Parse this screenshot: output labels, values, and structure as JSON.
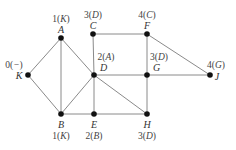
{
  "graph": {
    "nodes": [
      {
        "id": "A",
        "x": 61,
        "y": 38,
        "label": "A",
        "annotation": "1(K)",
        "ann_num": "1",
        "ann_pred": "K",
        "pos": "above"
      },
      {
        "id": "C",
        "x": 93,
        "y": 34,
        "label": "C",
        "annotation": "3(D)",
        "ann_num": "3",
        "ann_pred": "D",
        "pos": "above"
      },
      {
        "id": "F",
        "x": 147,
        "y": 34,
        "label": "F",
        "annotation": "4(C)",
        "ann_num": "4",
        "ann_pred": "C",
        "pos": "above"
      },
      {
        "id": "K",
        "x": 28,
        "y": 75,
        "label": "K",
        "annotation": "0(−)",
        "ann_num": "0",
        "ann_pred": "−",
        "pos": "left"
      },
      {
        "id": "D",
        "x": 94,
        "y": 75,
        "label": "D",
        "annotation": "2(A)",
        "ann_num": "2",
        "ann_pred": "A",
        "pos": "aboveright"
      },
      {
        "id": "G",
        "x": 147,
        "y": 75,
        "label": "G",
        "annotation": "3(D)",
        "ann_num": "3",
        "ann_pred": "D",
        "pos": "aboveright"
      },
      {
        "id": "J",
        "x": 210,
        "y": 75,
        "label": "J",
        "annotation": "4(G)",
        "ann_num": "4",
        "ann_pred": "G",
        "pos": "right"
      },
      {
        "id": "B",
        "x": 61,
        "y": 114,
        "label": "B",
        "annotation": "1(K)",
        "ann_num": "1",
        "ann_pred": "K",
        "pos": "below"
      },
      {
        "id": "E",
        "x": 94,
        "y": 114,
        "label": "E",
        "annotation": "2(B)",
        "ann_num": "2",
        "ann_pred": "B",
        "pos": "below"
      },
      {
        "id": "H",
        "x": 147,
        "y": 114,
        "label": "H",
        "annotation": "3(D)",
        "ann_num": "3",
        "ann_pred": "D",
        "pos": "below"
      }
    ],
    "edges": [
      [
        "K",
        "A"
      ],
      [
        "K",
        "B"
      ],
      [
        "A",
        "B"
      ],
      [
        "A",
        "D"
      ],
      [
        "B",
        "D"
      ],
      [
        "B",
        "E"
      ],
      [
        "D",
        "E"
      ],
      [
        "C",
        "D"
      ],
      [
        "C",
        "F"
      ],
      [
        "F",
        "G"
      ],
      [
        "F",
        "J"
      ],
      [
        "D",
        "G"
      ],
      [
        "G",
        "J"
      ],
      [
        "D",
        "H"
      ],
      [
        "G",
        "H"
      ],
      [
        "E",
        "H"
      ]
    ],
    "colors": {
      "edge": "#8a8a8a",
      "node": "#111111",
      "text": "#333333"
    }
  }
}
